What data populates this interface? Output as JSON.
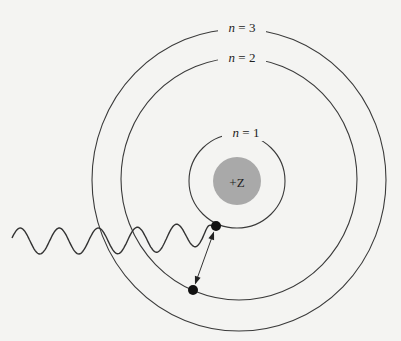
{
  "figure": {
    "nucleus": {
      "label": "+Z",
      "center": [
        237,
        181
      ],
      "radius": 24,
      "color": "#a9a9a9"
    },
    "orbits": [
      {
        "n_symbol": "n",
        "equals": " = 1",
        "level": 1,
        "label_pos": [
          246,
          137
        ],
        "center": [
          237,
          181
        ],
        "rx": 48,
        "ry": 47
      },
      {
        "n_symbol": "n",
        "equals": " = 2",
        "level": 2,
        "label_pos": [
          242,
          62
        ],
        "center": [
          239,
          179
        ],
        "rx": 118,
        "ry": 121
      },
      {
        "n_symbol": "n",
        "equals": " = 3",
        "level": 3,
        "label_pos": [
          242,
          32
        ],
        "center": [
          239,
          180
        ],
        "rx": 147,
        "ry": 151
      }
    ],
    "electrons": [
      {
        "name": "electron-initial",
        "orbit": 1,
        "position": [
          216,
          226
        ],
        "radius": 5
      },
      {
        "name": "electron-final",
        "orbit": 3,
        "position": [
          193,
          290
        ],
        "radius": 5
      }
    ],
    "photon": {
      "type": "incoming-wave",
      "start": [
        12,
        241
      ],
      "end": [
        214,
        228
      ],
      "wavelength": 39,
      "amplitude": 13
    },
    "transition_arrow": {
      "from": [
        216,
        226
      ],
      "to": [
        193,
        290
      ],
      "double_headed": true
    },
    "colors": {
      "background": "#f4f4f2",
      "line": "#3a3a3a",
      "nucleus": "#a9a9a9",
      "electron": "#111111"
    }
  }
}
